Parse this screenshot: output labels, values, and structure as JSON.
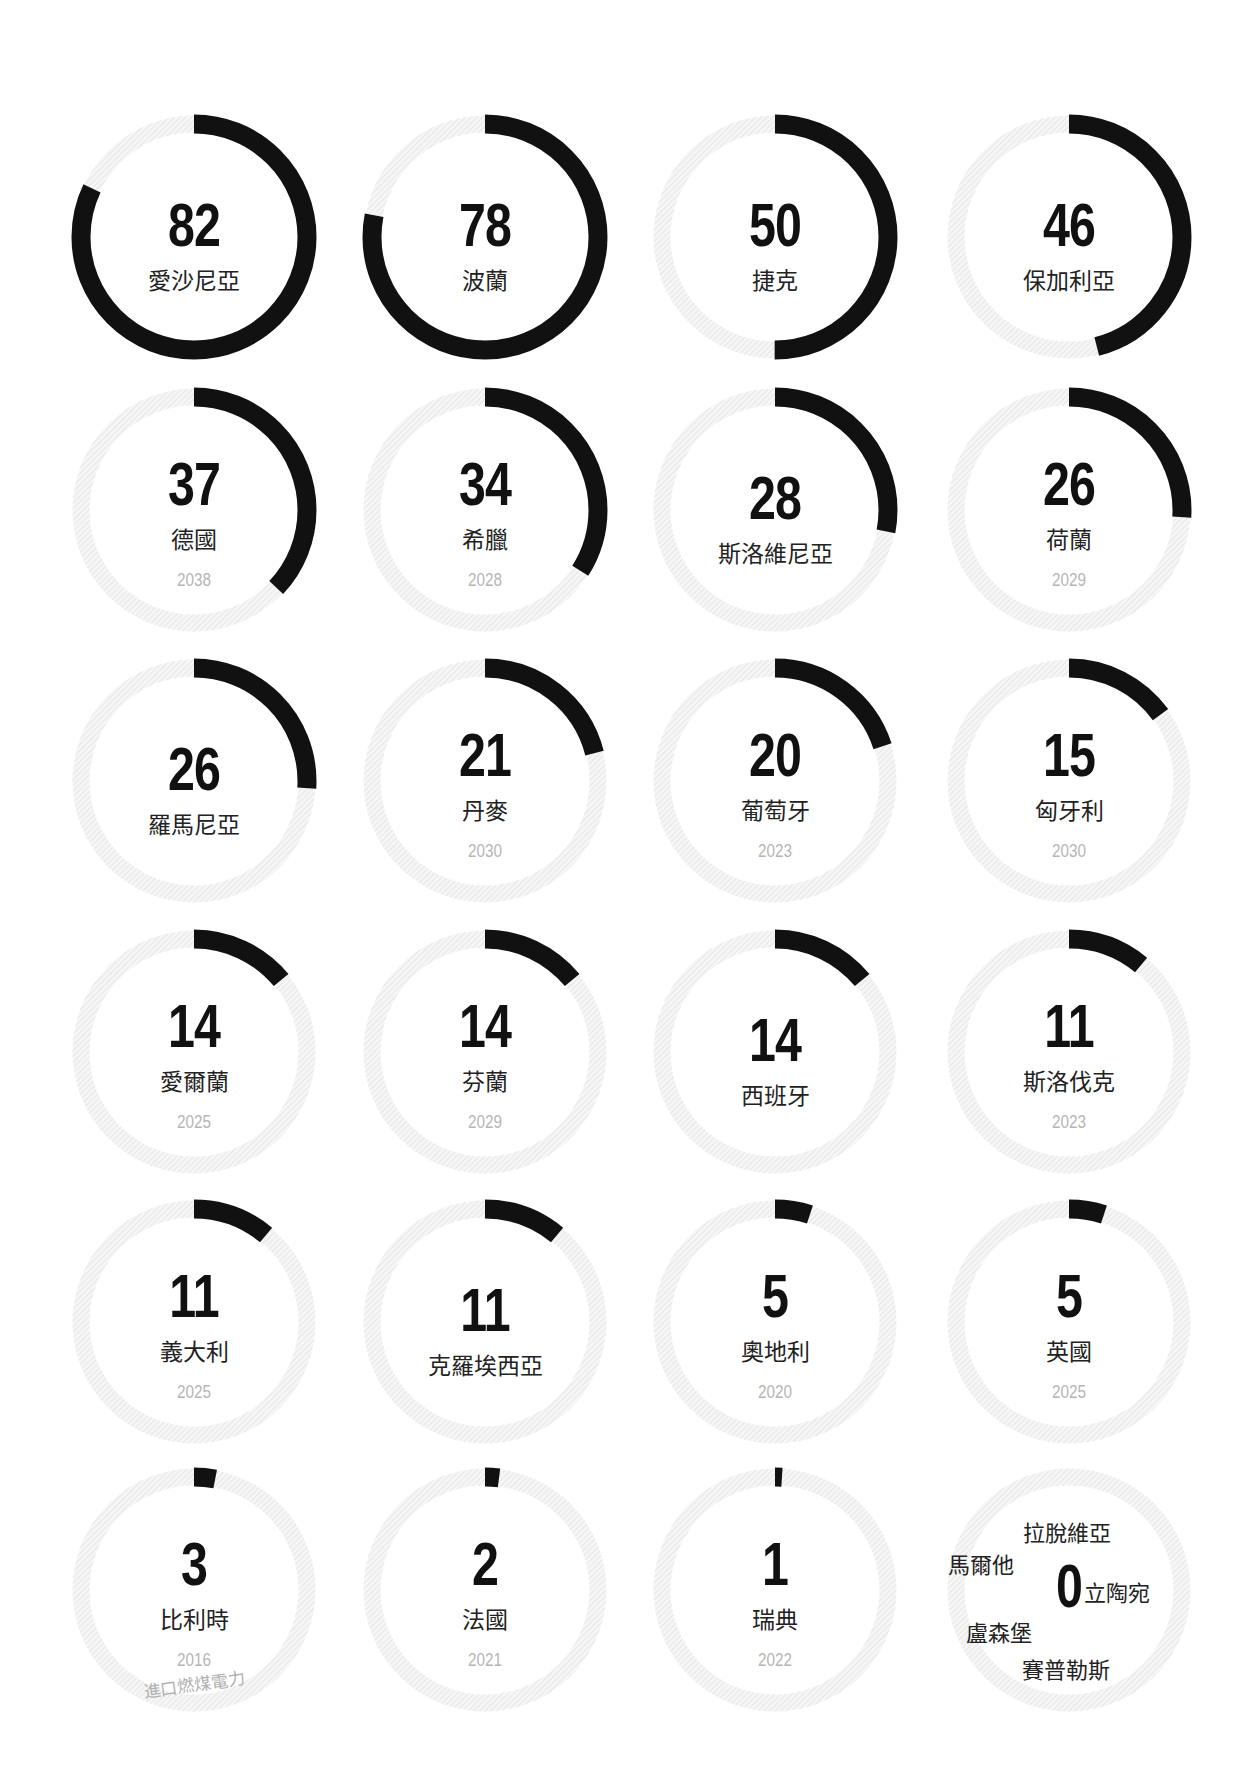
{
  "chart_data": {
    "type": "radial-progress-grid",
    "title": "",
    "max": 100,
    "colors": {
      "filled": "#111111",
      "track": "#efefef",
      "map": "#a9a9a9",
      "year": "#b5b5b5"
    },
    "items": [
      {
        "country": "愛沙尼亞",
        "value": 82,
        "year": ""
      },
      {
        "country": "波蘭",
        "value": 78,
        "year": ""
      },
      {
        "country": "捷克",
        "value": 50,
        "year": ""
      },
      {
        "country": "保加利亞",
        "value": 46,
        "year": ""
      },
      {
        "country": "德國",
        "value": 37,
        "year": "2038"
      },
      {
        "country": "希臘",
        "value": 34,
        "year": "2028"
      },
      {
        "country": "斯洛維尼亞",
        "value": 28,
        "year": ""
      },
      {
        "country": "荷蘭",
        "value": 26,
        "year": "2029"
      },
      {
        "country": "羅馬尼亞",
        "value": 26,
        "year": ""
      },
      {
        "country": "丹麥",
        "value": 21,
        "year": "2030"
      },
      {
        "country": "葡萄牙",
        "value": 20,
        "year": "2023"
      },
      {
        "country": "匈牙利",
        "value": 15,
        "year": "2030"
      },
      {
        "country": "愛爾蘭",
        "value": 14,
        "year": "2025"
      },
      {
        "country": "芬蘭",
        "value": 14,
        "year": "2029"
      },
      {
        "country": "西班牙",
        "value": 14,
        "year": ""
      },
      {
        "country": "斯洛伐克",
        "value": 11,
        "year": "2023"
      },
      {
        "country": "義大利",
        "value": 11,
        "year": "2025"
      },
      {
        "country": "克羅埃西亞",
        "value": 11,
        "year": ""
      },
      {
        "country": "奧地利",
        "value": 5,
        "year": "2020"
      },
      {
        "country": "英國",
        "value": 5,
        "year": "2025"
      },
      {
        "country": "比利時",
        "value": 3,
        "year": "2016",
        "note": "進口燃煤電力"
      },
      {
        "country": "法國",
        "value": 2,
        "year": "2021"
      },
      {
        "country": "瑞典",
        "value": 1,
        "year": "2022"
      },
      {
        "country": "",
        "value": 0,
        "year": ""
      }
    ],
    "zero_group": {
      "value": 0,
      "countries": [
        "拉脫維亞",
        "馬爾他",
        "立陶宛",
        "盧森堡",
        "賽普勒斯"
      ]
    }
  }
}
